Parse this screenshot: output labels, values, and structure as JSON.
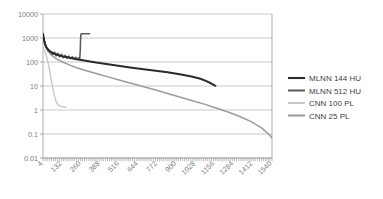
{
  "chart_data": {
    "type": "line",
    "title": "",
    "subtitle": "",
    "xlabel": "",
    "ylabel": "",
    "yscale": "log",
    "ylim": [
      0.01,
      10000
    ],
    "xlim": [
      4,
      1540
    ],
    "grid": true,
    "legend_position": "right",
    "y_ticks": [
      "10000",
      "1000",
      "100",
      "10",
      "1",
      "0.1",
      "0.01"
    ],
    "y_tick_values": [
      10000,
      1000,
      100,
      10,
      1,
      0.1,
      0.01
    ],
    "x_ticks": [
      "4",
      "132",
      "260",
      "388",
      "516",
      "644",
      "772",
      "900",
      "1028",
      "1156",
      "1284",
      "1412",
      "1540"
    ],
    "x_tick_values": [
      4,
      132,
      260,
      388,
      516,
      644,
      772,
      900,
      1028,
      1156,
      1284,
      1412,
      1540
    ],
    "series": [
      {
        "name": "MLNN 144 HU",
        "color": "#2b2b2b",
        "width": 2.0,
        "points": [
          [
            4,
            1500
          ],
          [
            10,
            900
          ],
          [
            18,
            560
          ],
          [
            28,
            400
          ],
          [
            40,
            320
          ],
          [
            60,
            255
          ],
          [
            84,
            215
          ],
          [
            110,
            190
          ],
          [
            140,
            170
          ],
          [
            180,
            150
          ],
          [
            230,
            130
          ],
          [
            290,
            112
          ],
          [
            360,
            95
          ],
          [
            440,
            80
          ],
          [
            520,
            68
          ],
          [
            600,
            58
          ],
          [
            680,
            50
          ],
          [
            760,
            43
          ],
          [
            840,
            37
          ],
          [
            920,
            31
          ],
          [
            1000,
            25
          ],
          [
            1060,
            20
          ],
          [
            1100,
            16
          ],
          [
            1130,
            13
          ],
          [
            1156,
            10.5
          ],
          [
            1160,
            10.2
          ]
        ]
      },
      {
        "name": "MLNN 512 HU",
        "color": "#5e5e5e",
        "width": 1.6,
        "points": [
          [
            4,
            1400
          ],
          [
            10,
            880
          ],
          [
            18,
            540
          ],
          [
            28,
            390
          ],
          [
            40,
            300
          ],
          [
            56,
            250
          ],
          [
            70,
            205
          ],
          [
            82,
            255
          ],
          [
            92,
            180
          ],
          [
            104,
            230
          ],
          [
            116,
            165
          ],
          [
            128,
            210
          ],
          [
            140,
            150
          ],
          [
            152,
            190
          ],
          [
            164,
            145
          ],
          [
            176,
            175
          ],
          [
            188,
            140
          ],
          [
            200,
            165
          ],
          [
            212,
            135
          ],
          [
            224,
            155
          ],
          [
            234,
            128
          ],
          [
            244,
            150
          ],
          [
            250,
            130
          ],
          [
            254,
            300
          ],
          [
            256,
            800
          ],
          [
            258,
            1400
          ],
          [
            260,
            1500
          ],
          [
            300,
            1500
          ],
          [
            316,
            1500
          ]
        ]
      },
      {
        "name": "CNN 100 PL",
        "color": "#c8c8c8",
        "width": 1.4,
        "points": [
          [
            4,
            400
          ],
          [
            10,
            330
          ],
          [
            18,
            260
          ],
          [
            26,
            190
          ],
          [
            34,
            120
          ],
          [
            42,
            70
          ],
          [
            50,
            38
          ],
          [
            58,
            20
          ],
          [
            66,
            11
          ],
          [
            74,
            6.2
          ],
          [
            82,
            3.6
          ],
          [
            92,
            2.3
          ],
          [
            102,
            1.75
          ],
          [
            114,
            1.48
          ],
          [
            128,
            1.38
          ],
          [
            144,
            1.33
          ],
          [
            158,
            1.3
          ]
        ]
      },
      {
        "name": "CNN 25 PL",
        "color": "#9b9b9b",
        "width": 1.5,
        "points": [
          [
            4,
            900
          ],
          [
            12,
            600
          ],
          [
            24,
            400
          ],
          [
            40,
            270
          ],
          [
            60,
            195
          ],
          [
            84,
            150
          ],
          [
            112,
            118
          ],
          [
            144,
            95
          ],
          [
            184,
            74
          ],
          [
            230,
            58
          ],
          [
            290,
            44
          ],
          [
            360,
            33
          ],
          [
            440,
            24
          ],
          [
            520,
            17.5
          ],
          [
            600,
            12.8
          ],
          [
            680,
            9.3
          ],
          [
            760,
            6.8
          ],
          [
            840,
            4.9
          ],
          [
            920,
            3.5
          ],
          [
            1000,
            2.5
          ],
          [
            1080,
            1.8
          ],
          [
            1160,
            1.25
          ],
          [
            1240,
            0.85
          ],
          [
            1320,
            0.55
          ],
          [
            1400,
            0.33
          ],
          [
            1470,
            0.18
          ],
          [
            1520,
            0.095
          ],
          [
            1540,
            0.07
          ]
        ]
      }
    ],
    "legend_entries": [
      {
        "label": "MLNN 144 HU",
        "color": "#2b2b2b"
      },
      {
        "label": "MLNN 512 HU",
        "color": "#5e5e5e"
      },
      {
        "label": "CNN 100 PL",
        "color": "#c8c8c8"
      },
      {
        "label": "CNN 25 PL",
        "color": "#9b9b9b"
      }
    ]
  },
  "plot": {
    "area_left": 43,
    "area_right": 272,
    "area_top": 14,
    "area_bottom": 158
  }
}
